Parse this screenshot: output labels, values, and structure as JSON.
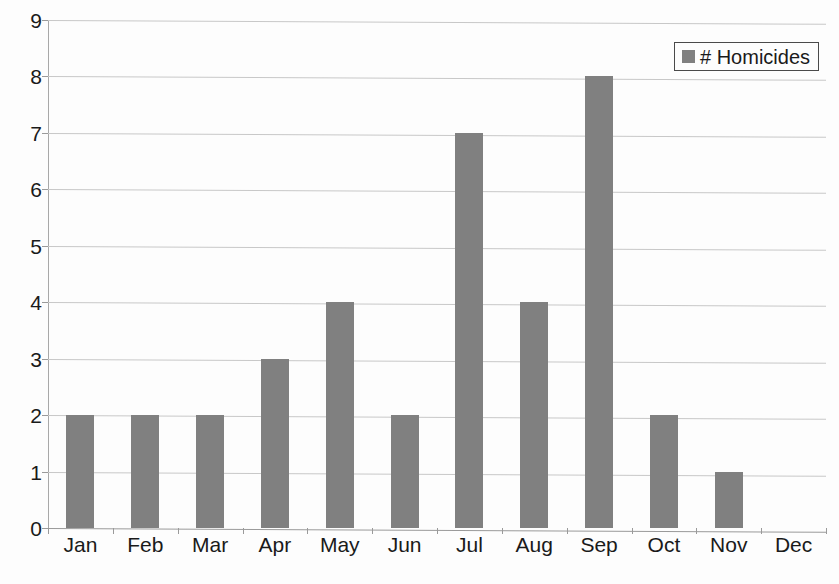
{
  "chart_data": {
    "type": "bar",
    "title": "",
    "subtitle": "",
    "xlabel": "",
    "ylabel": "",
    "categories": [
      "Jan",
      "Feb",
      "Mar",
      "Apr",
      "May",
      "Jun",
      "Jul",
      "Aug",
      "Sep",
      "Oct",
      "Nov",
      "Dec"
    ],
    "values": [
      2,
      2,
      2,
      3,
      4,
      2,
      7,
      4,
      8,
      2,
      1,
      0
    ],
    "series": [
      {
        "name": "# Homicides",
        "values": [
          2,
          2,
          2,
          3,
          4,
          2,
          7,
          4,
          8,
          2,
          1,
          0
        ],
        "color": "#808080"
      }
    ],
    "ylim": [
      0,
      9
    ],
    "ytick_step": 1,
    "yticks": [
      "9",
      "8",
      "7",
      "6",
      "5",
      "4",
      "3",
      "2",
      "1",
      "0"
    ],
    "ytick_values": [
      9,
      8,
      7,
      6,
      5,
      4,
      3,
      2,
      1,
      0
    ],
    "grid": true,
    "grid_axis": "y",
    "legend_position": "top-right",
    "annotations": []
  },
  "legend": {
    "entries": [
      {
        "label": "# Homicides",
        "swatch_icon": "square-swatch-icon",
        "color": "#808080"
      }
    ]
  },
  "colors": {
    "bar": "#808080",
    "background": "#fdfdfd",
    "gridline": "#c8c8c8",
    "axis": "#9a9a9a",
    "text": "#1a1a1a",
    "legend_border": "#4a4a4a"
  }
}
